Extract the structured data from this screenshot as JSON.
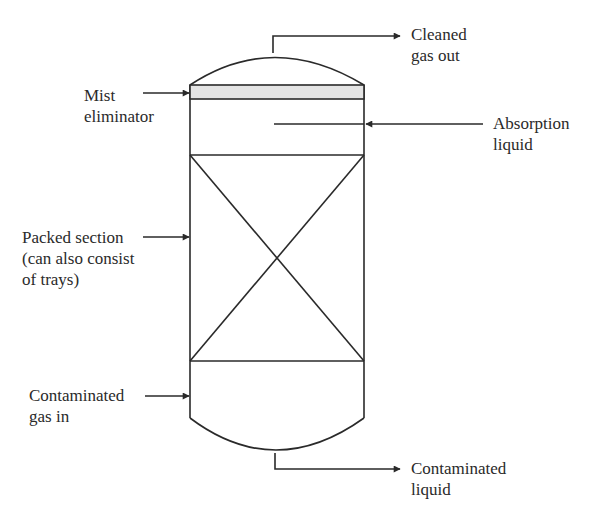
{
  "diagram": {
    "colors": {
      "line": "#2a2a2a",
      "mist_band": "#e4e4e4",
      "background": "#ffffff"
    },
    "labels": {
      "cleaned_gas_out": {
        "line1": "Cleaned",
        "line2": "gas out"
      },
      "mist_eliminator": {
        "line1": "Mist",
        "line2": "eliminator"
      },
      "absorption_liquid": {
        "line1": "Absorption",
        "line2": "liquid"
      },
      "packed_section": {
        "line1": "Packed section",
        "line2": "(can also consist",
        "line3": "of trays)"
      },
      "contaminated_gas_in": {
        "line1": "Contaminated",
        "line2": "gas in"
      },
      "contaminated_liquid": {
        "line1": "Contaminated",
        "line2": "liquid"
      }
    }
  }
}
